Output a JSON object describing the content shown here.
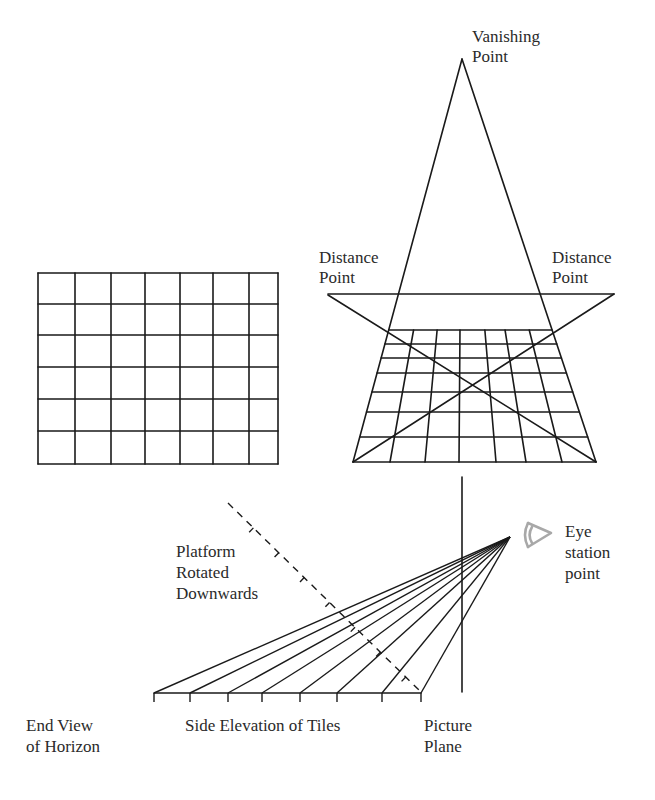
{
  "diagram": {
    "labels": {
      "vanishing_point": [
        "Vanishing",
        "Point"
      ],
      "distance_point_left": [
        "Distance",
        "Point"
      ],
      "distance_point_right": [
        "Distance",
        "Point"
      ],
      "platform": [
        "Platform",
        "Rotated",
        "Downwards"
      ],
      "eye": [
        "Eye",
        "station",
        "point"
      ],
      "end_view": [
        "End View",
        "of Horizon"
      ],
      "side_elevation": "Side Elevation of Tiles",
      "picture_plane": [
        "Picture",
        "Plane"
      ]
    },
    "plan_grid": {
      "columns": 7,
      "rows": 6,
      "x_lines": [
        38,
        75,
        111,
        145,
        180,
        213,
        249,
        278
      ],
      "y_lines": [
        273,
        304,
        335,
        367,
        399,
        431,
        464
      ]
    },
    "perspective_grid": {
      "vanishing_point": [
        462,
        59
      ],
      "horizon_y": 294,
      "distance_point_left": [
        328,
        295
      ],
      "distance_point_right": [
        614,
        294
      ],
      "top_y": 330,
      "bottom_y": 462,
      "bottom_x": [
        353,
        390,
        425,
        459,
        496,
        526,
        562,
        596
      ],
      "row_y": [
        330,
        344,
        358,
        373,
        392,
        412,
        437,
        462
      ]
    },
    "side_elevation": {
      "base_y": 693,
      "tick_x": [
        154,
        190,
        228,
        262,
        300,
        337,
        382,
        421
      ],
      "eye_point": [
        510,
        537
      ],
      "picture_plane_x": 462,
      "picture_plane_y": [
        477,
        692
      ],
      "dashed_platform_start": [
        228,
        503
      ],
      "dashed_platform_end": [
        421,
        692
      ]
    },
    "colors": {
      "line": "#1a1a1a",
      "eye_icon": "#a8a8a8",
      "text": "#2a2a2a"
    }
  }
}
